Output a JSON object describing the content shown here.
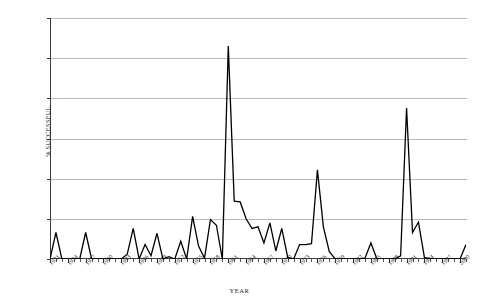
{
  "chart_data": {
    "type": "line",
    "title": "",
    "xlabel": "YEAR",
    "ylabel": "% SUCCESSFUL",
    "xlim": [
      1931,
      2001
    ],
    "ylim": [
      0,
      0.3
    ],
    "grid": true,
    "legend": "none",
    "ytick_labels": [
      "0",
      "0.05",
      "0.1",
      "0.15",
      "0.2",
      "0.25",
      "0.3"
    ],
    "ytick_values": [
      0,
      0.05,
      0.1,
      0.15,
      0.2,
      0.25,
      0.3
    ],
    "xtick_labels": [
      "1931",
      "1934",
      "1937",
      "1940",
      "1943",
      "1946",
      "1949",
      "1952",
      "1955",
      "1958",
      "1961",
      "1964",
      "1967",
      "1970",
      "1973",
      "1976",
      "1979",
      "1982",
      "1985",
      "1988",
      "1991",
      "1994",
      "1997",
      "2000"
    ],
    "xtick_values": [
      1931,
      1934,
      1937,
      1940,
      1943,
      1946,
      1949,
      1952,
      1955,
      1958,
      1961,
      1964,
      1967,
      1970,
      1973,
      1976,
      1979,
      1982,
      1985,
      1988,
      1991,
      1994,
      1997,
      2000
    ],
    "series": [
      {
        "name": "% successful",
        "color": "#000000",
        "x": [
          1931,
          1932,
          1933,
          1934,
          1935,
          1936,
          1937,
          1938,
          1939,
          1940,
          1941,
          1942,
          1943,
          1944,
          1945,
          1946,
          1947,
          1948,
          1949,
          1950,
          1951,
          1952,
          1953,
          1954,
          1955,
          1956,
          1957,
          1958,
          1959,
          1960,
          1961,
          1962,
          1963,
          1964,
          1965,
          1966,
          1967,
          1968,
          1969,
          1970,
          1971,
          1972,
          1973,
          1974,
          1975,
          1976,
          1977,
          1978,
          1979,
          1980,
          1981,
          1982,
          1983,
          1984,
          1985,
          1986,
          1987,
          1988,
          1989,
          1990,
          1991,
          1992,
          1993,
          1994,
          1995,
          1996,
          1997,
          1998,
          1999,
          2000,
          2001
        ],
        "values": [
          0,
          0.033,
          0,
          0,
          0,
          0,
          0.033,
          0,
          0,
          0,
          0,
          0,
          0,
          0.006,
          0.038,
          0,
          0.018,
          0.004,
          0.032,
          0,
          0.003,
          0,
          0.022,
          0,
          0.053,
          0.016,
          0.001,
          0.049,
          0.042,
          0,
          0.265,
          0.072,
          0.071,
          0.05,
          0.038,
          0.04,
          0.02,
          0.045,
          0.01,
          0.038,
          0.002,
          0,
          0.018,
          0.018,
          0.019,
          0.111,
          0.04,
          0.009,
          0,
          0,
          0,
          0,
          0,
          0.001,
          0.02,
          0,
          0,
          0,
          0,
          0.004,
          0.188,
          0.033,
          0.046,
          0.002,
          0,
          0,
          0,
          0,
          0,
          0,
          0.018
        ]
      }
    ]
  }
}
